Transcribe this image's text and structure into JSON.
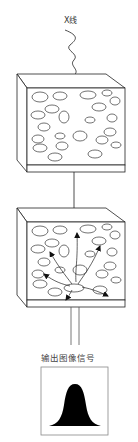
{
  "diagram": {
    "input_label": "X线",
    "output_label": "输出图像信号",
    "stages": [
      {
        "name": "absorption-layer",
        "description": "X-ray enters scintillator layer with particles"
      },
      {
        "name": "light-emission-layer",
        "description": "Light scattered from absorption point toward detector"
      }
    ],
    "output_signal_shape": "bell-curve"
  },
  "colors": {
    "stroke": "#222222",
    "fill": "#000000",
    "background": "#ffffff"
  }
}
